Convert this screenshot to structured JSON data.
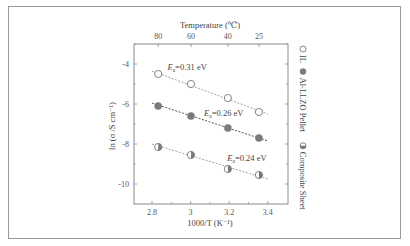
{
  "chart_data": {
    "type": "scatter",
    "title": "",
    "xlabel": "1000/T (K⁻¹)",
    "ylabel": "ln (σ /S cm⁻¹)",
    "top_axis_label": "Temperature (℃)",
    "xlim": [
      2.72,
      3.5
    ],
    "ylim": [
      -11,
      -3
    ],
    "x_ticks": [
      2.8,
      3.0,
      3.2,
      3.4
    ],
    "x_tick_labels": [
      "2.8",
      "3",
      "3.2",
      "3.4"
    ],
    "y_ticks": [
      -4,
      -6,
      -8,
      -10
    ],
    "y_tick_labels": [
      "-4",
      "-6",
      "-8",
      "-10"
    ],
    "top_ticks": [
      {
        "label": "80",
        "x": 2.832
      },
      {
        "label": "60",
        "x": 3.002
      },
      {
        "label": "40",
        "x": 3.193
      },
      {
        "label": "25",
        "x": 3.354
      }
    ],
    "grid": false,
    "legend_placement": "right (rotated vertical)",
    "series": [
      {
        "name": "IL",
        "marker": "open-circle",
        "x": [
          2.832,
          3.002,
          3.193,
          3.354
        ],
        "y": [
          -4.5,
          -5.0,
          -5.7,
          -6.4
        ],
        "fit": {
          "x": [
            2.8,
            3.4
          ],
          "y": [
            -4.35,
            -6.5
          ]
        },
        "annotation": {
          "text_prefix": "E",
          "text_sub": "a",
          "text_suffix": "=0.31 eV",
          "x": 2.88,
          "y": -4.3
        }
      },
      {
        "name": "Al-LLZO Pellet",
        "marker": "filled-circle",
        "x": [
          2.832,
          3.002,
          3.193,
          3.354
        ],
        "y": [
          -6.1,
          -6.6,
          -7.2,
          -7.7
        ],
        "fit": {
          "x": [
            2.8,
            3.4
          ],
          "y": [
            -5.95,
            -7.85
          ]
        },
        "annotation": {
          "text_prefix": "E",
          "text_sub": "a",
          "text_suffix": "=0.26 eV",
          "x": 3.07,
          "y": -6.6
        }
      },
      {
        "name": "Composite Sheet",
        "marker": "half-filled-circle",
        "x": [
          2.832,
          3.002,
          3.193,
          3.354
        ],
        "y": [
          -8.15,
          -8.55,
          -9.25,
          -9.55
        ],
        "fit": {
          "x": [
            2.8,
            3.4
          ],
          "y": [
            -8.0,
            -9.75
          ]
        },
        "annotation": {
          "text_prefix": "E",
          "text_sub": "a",
          "text_suffix": "=0.24 eV",
          "x": 3.19,
          "y": -8.85
        }
      }
    ]
  },
  "legend": {
    "items": [
      {
        "label": "IL",
        "marker": "open-circle"
      },
      {
        "label": "Al-LLZO Pellet",
        "marker": "filled-circle"
      },
      {
        "label": "Composite Sheet",
        "marker": "half-filled-circle"
      }
    ]
  },
  "colors": {
    "axis": "#8a8a8a",
    "marker_fill": "#7a7a7a",
    "marker_stroke": "#777777",
    "fit_line": "#8a8a8a",
    "fit_line_dark": "#555555",
    "text": "#444444"
  }
}
